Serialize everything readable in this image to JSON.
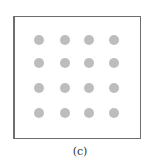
{
  "figure": {
    "caption": "(c)",
    "grid": {
      "rows": 4,
      "cols": 4
    },
    "dot_color": "#bdbdbd",
    "frame_color": "#6e6e6e"
  }
}
